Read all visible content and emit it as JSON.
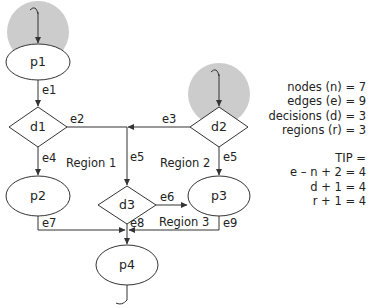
{
  "nodes": {
    "p1": "p1",
    "d1": "d1",
    "p2": "p2",
    "d2": "d2",
    "d3": "d3",
    "p3": "p3",
    "p4": "p4"
  },
  "edges": {
    "e1": "e1",
    "e2": "e2",
    "e3": "e3",
    "e4": "e4",
    "e5a": "e5",
    "e5b": "e5",
    "e6": "e6",
    "e7": "e7",
    "e8": "e8",
    "e9": "e9"
  },
  "regions": {
    "r1": "Region 1",
    "r2": "Region 2",
    "r3": "Region 3"
  },
  "stats": {
    "nodes": "nodes (n) = 7",
    "edges": "edges (e) = 9",
    "decisions": "decisions (d) = 3",
    "regions": "regions (r) = 3",
    "tip_title": "TIP =",
    "tip1": "e – n + 2 = 4",
    "tip2": "d + 1 = 4",
    "tip3": "r + 1 = 4"
  },
  "colors": {
    "highlight": "#cccccc",
    "stroke": "#333333"
  }
}
